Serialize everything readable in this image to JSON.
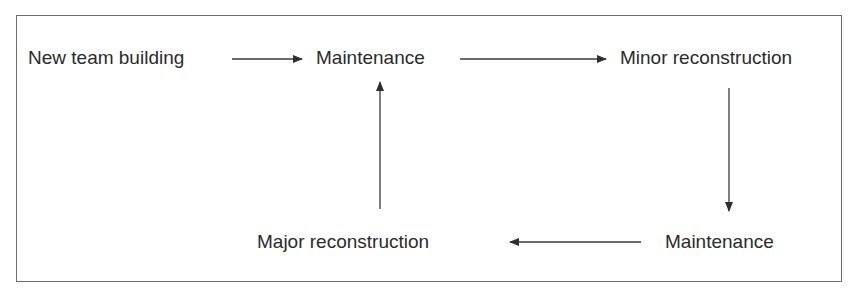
{
  "diagram": {
    "type": "flow",
    "nodes": [
      {
        "id": "n1",
        "label": "New team building"
      },
      {
        "id": "n2",
        "label": "Maintenance"
      },
      {
        "id": "n3",
        "label": "Minor reconstruction"
      },
      {
        "id": "n4",
        "label": "Maintenance"
      },
      {
        "id": "n5",
        "label": "Major reconstruction"
      }
    ],
    "edges": [
      {
        "from": "n1",
        "to": "n2",
        "direction": "right"
      },
      {
        "from": "n2",
        "to": "n3",
        "direction": "right"
      },
      {
        "from": "n3",
        "to": "n4",
        "direction": "down"
      },
      {
        "from": "n4",
        "to": "n5",
        "direction": "left"
      },
      {
        "from": "n5",
        "to": "n2",
        "direction": "up"
      }
    ],
    "colors": {
      "line": "#3a3a3a",
      "border": "#6e6e6e",
      "text": "#2b2b2b"
    }
  }
}
